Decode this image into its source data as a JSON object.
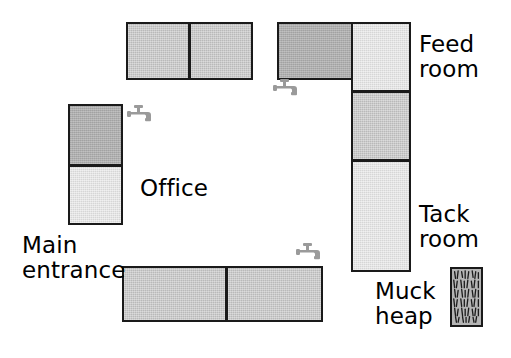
{
  "diagram": {
    "background_color": "#ffffff",
    "outline_color": "#1a1a1a",
    "fill_mid": "#b9b9b9",
    "fill_dark": "#aeaeae",
    "fill_light": "#d6d6d6"
  },
  "labels": {
    "office": "Office",
    "main_entrance": "Main\nentrance",
    "feed_room": "Feed\nroom",
    "tack_room": "Tack\nroom",
    "muck_heap": "Muck\nheap"
  },
  "icons": {
    "tap_north": "tap-icon",
    "tap_office": "tap-icon",
    "tap_south": "tap-icon",
    "muck_heap": "muck-heap-icon"
  },
  "structures": [
    {
      "name": "north-stable-block",
      "orientation": "horizontal",
      "cells": [
        {
          "name": "north-stable-cell-1",
          "shade": "mid"
        },
        {
          "name": "north-stable-cell-2",
          "shade": "mid"
        }
      ]
    },
    {
      "name": "office-block",
      "orientation": "vertical",
      "cells": [
        {
          "name": "office-cell-upper",
          "shade": "dark"
        },
        {
          "name": "office-cell-lower",
          "shade": "light"
        }
      ]
    },
    {
      "name": "feed-room-wing",
      "orientation": "horizontal",
      "cells": [
        {
          "name": "feed-room-wing-cell",
          "shade": "dark"
        }
      ]
    },
    {
      "name": "east-stable-block",
      "orientation": "vertical",
      "cells": [
        {
          "name": "feed-room-cell",
          "shade": "light"
        },
        {
          "name": "east-stable-cell-middle",
          "shade": "mid"
        },
        {
          "name": "tack-room-cell",
          "shade": "light"
        }
      ]
    },
    {
      "name": "south-stable-block",
      "orientation": "horizontal",
      "cells": [
        {
          "name": "south-stable-cell-1",
          "shade": "mid"
        },
        {
          "name": "south-stable-cell-2",
          "shade": "mid"
        }
      ]
    }
  ]
}
